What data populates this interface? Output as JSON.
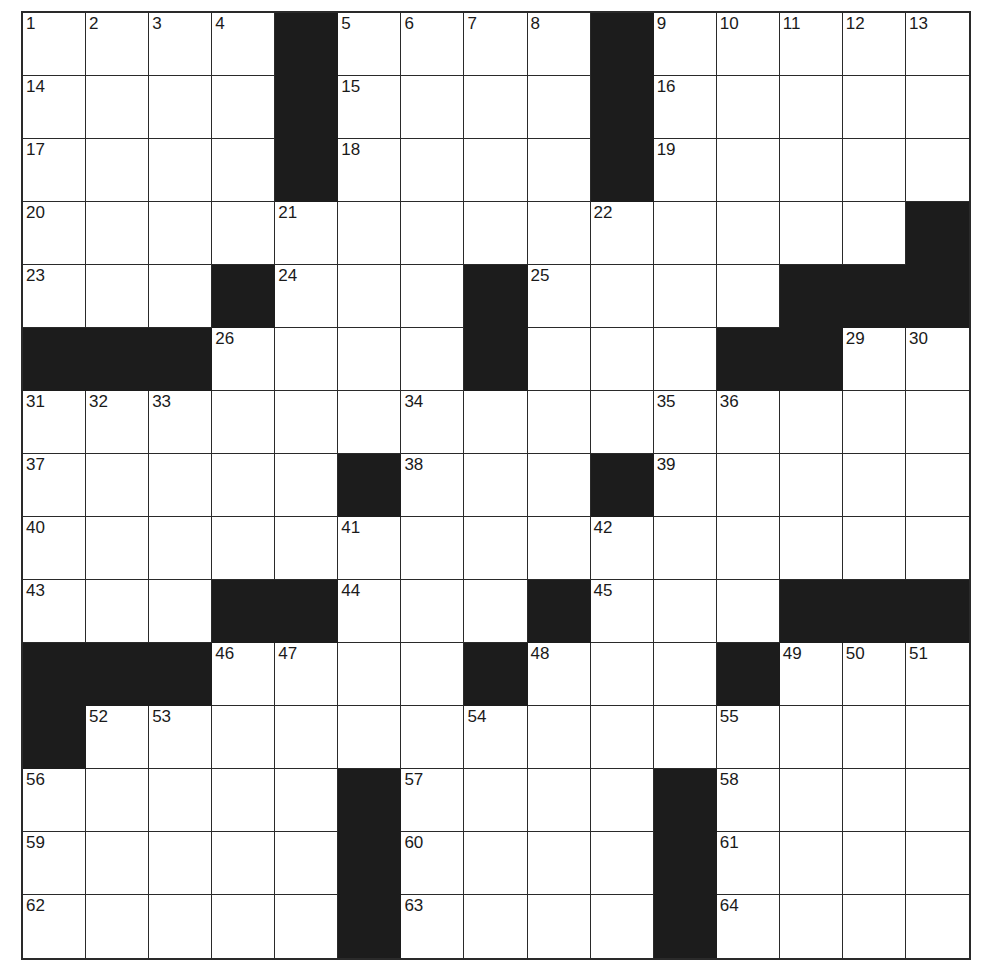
{
  "puzzle": {
    "rows": 15,
    "cols": 15,
    "colors": {
      "block": "#1c1c1c",
      "cell": "#ffffff",
      "line": "#2a2a2a"
    },
    "grid": [
      "....#....#.....",
      "....#....#.....",
      "....#....#.....",
      "..............#",
      "...#...#....###",
      "###....#...##...",
      "...............",
      ".....#...#.....",
      "...............",
      "...##...#...###",
      "###....#...#...",
      "#..............",
      ".....#....#....",
      ".....#....#....",
      ".....#....#...."
    ],
    "numbers": [
      {
        "r": 0,
        "c": 0,
        "n": "1"
      },
      {
        "r": 0,
        "c": 1,
        "n": "2"
      },
      {
        "r": 0,
        "c": 2,
        "n": "3"
      },
      {
        "r": 0,
        "c": 3,
        "n": "4"
      },
      {
        "r": 0,
        "c": 5,
        "n": "5"
      },
      {
        "r": 0,
        "c": 6,
        "n": "6"
      },
      {
        "r": 0,
        "c": 7,
        "n": "7"
      },
      {
        "r": 0,
        "c": 8,
        "n": "8"
      },
      {
        "r": 0,
        "c": 10,
        "n": "9"
      },
      {
        "r": 0,
        "c": 11,
        "n": "10"
      },
      {
        "r": 0,
        "c": 12,
        "n": "11"
      },
      {
        "r": 0,
        "c": 13,
        "n": "12"
      },
      {
        "r": 0,
        "c": 14,
        "n": "13"
      },
      {
        "r": 1,
        "c": 0,
        "n": "14"
      },
      {
        "r": 1,
        "c": 5,
        "n": "15"
      },
      {
        "r": 1,
        "c": 10,
        "n": "16"
      },
      {
        "r": 2,
        "c": 0,
        "n": "17"
      },
      {
        "r": 2,
        "c": 5,
        "n": "18"
      },
      {
        "r": 2,
        "c": 10,
        "n": "19"
      },
      {
        "r": 3,
        "c": 0,
        "n": "20"
      },
      {
        "r": 3,
        "c": 4,
        "n": "21"
      },
      {
        "r": 3,
        "c": 9,
        "n": "22"
      },
      {
        "r": 4,
        "c": 0,
        "n": "23"
      },
      {
        "r": 4,
        "c": 4,
        "n": "24"
      },
      {
        "r": 4,
        "c": 8,
        "n": "25"
      },
      {
        "r": 5,
        "c": 3,
        "n": "26"
      },
      {
        "r": 5,
        "c": 7,
        "n": "27"
      },
      {
        "r": 5,
        "c": 12,
        "n": "28"
      },
      {
        "r": 5,
        "c": 13,
        "n": "29"
      },
      {
        "r": 5,
        "c": 14,
        "n": "30"
      },
      {
        "r": 6,
        "c": 0,
        "n": "31"
      },
      {
        "r": 6,
        "c": 1,
        "n": "32"
      },
      {
        "r": 6,
        "c": 2,
        "n": "33"
      },
      {
        "r": 6,
        "c": 6,
        "n": "34"
      },
      {
        "r": 6,
        "c": 10,
        "n": "35"
      },
      {
        "r": 6,
        "c": 11,
        "n": "36"
      },
      {
        "r": 7,
        "c": 0,
        "n": "37"
      },
      {
        "r": 7,
        "c": 6,
        "n": "38"
      },
      {
        "r": 7,
        "c": 10,
        "n": "39"
      },
      {
        "r": 8,
        "c": 0,
        "n": "40"
      },
      {
        "r": 8,
        "c": 5,
        "n": "41"
      },
      {
        "r": 8,
        "c": 9,
        "n": "42"
      },
      {
        "r": 9,
        "c": 0,
        "n": "43"
      },
      {
        "r": 9,
        "c": 5,
        "n": "44"
      },
      {
        "r": 9,
        "c": 9,
        "n": "45"
      },
      {
        "r": 10,
        "c": 3,
        "n": "46"
      },
      {
        "r": 10,
        "c": 4,
        "n": "47"
      },
      {
        "r": 10,
        "c": 8,
        "n": "48"
      },
      {
        "r": 10,
        "c": 12,
        "n": "49"
      },
      {
        "r": 10,
        "c": 13,
        "n": "50"
      },
      {
        "r": 10,
        "c": 14,
        "n": "51"
      },
      {
        "r": 11,
        "c": 1,
        "n": "52"
      },
      {
        "r": 11,
        "c": 2,
        "n": "53"
      },
      {
        "r": 11,
        "c": 7,
        "n": "54"
      },
      {
        "r": 11,
        "c": 11,
        "n": "55"
      },
      {
        "r": 12,
        "c": 0,
        "n": "56"
      },
      {
        "r": 12,
        "c": 6,
        "n": "57"
      },
      {
        "r": 12,
        "c": 11,
        "n": "58"
      },
      {
        "r": 13,
        "c": 0,
        "n": "59"
      },
      {
        "r": 13,
        "c": 6,
        "n": "60"
      },
      {
        "r": 13,
        "c": 11,
        "n": "61"
      },
      {
        "r": 14,
        "c": 0,
        "n": "62"
      },
      {
        "r": 14,
        "c": 6,
        "n": "63"
      },
      {
        "r": 14,
        "c": 11,
        "n": "64"
      }
    ],
    "letters": []
  }
}
